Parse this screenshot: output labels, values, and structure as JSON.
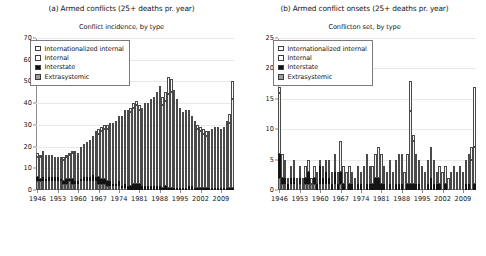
{
  "figure": {
    "panels": [
      {
        "id": "a",
        "title": "(a) Armed conflicts (25+ deaths pr. year)",
        "subtitle": "Conflict incidence, by type"
      },
      {
        "id": "b",
        "title": "(b) Armed conflict onsets (25+ deaths pr. year)",
        "subtitle": "Conflicton set, by type"
      }
    ],
    "legend": {
      "entries": [
        {
          "label": "Internationalized internal",
          "color": "#ffffff"
        },
        {
          "label": "Internal",
          "color": "#ffffff"
        },
        {
          "label": "Interstate",
          "color": "#101010"
        },
        {
          "label": "Extrasystemic",
          "color": "#9d9d9d"
        }
      ]
    }
  },
  "chart_data": [
    {
      "type": "bar",
      "stacked": true,
      "panel": "a",
      "title": "(a) Armed conflicts (25+ deaths pr. year)",
      "subtitle": "Conflict incidence, by type",
      "xlabel": "",
      "ylabel": "",
      "ylim": [
        0,
        70
      ],
      "yticks": [
        0,
        10,
        20,
        30,
        40,
        50,
        60,
        70
      ],
      "xticks": [
        1946,
        1953,
        1960,
        1967,
        1974,
        1981,
        1988,
        1995,
        2002,
        2009
      ],
      "grid": true,
      "legend_position": "upper-left",
      "categories": [
        1946,
        1947,
        1948,
        1949,
        1950,
        1951,
        1952,
        1953,
        1954,
        1955,
        1956,
        1957,
        1958,
        1959,
        1960,
        1961,
        1962,
        1963,
        1964,
        1965,
        1966,
        1967,
        1968,
        1969,
        1970,
        1971,
        1972,
        1973,
        1974,
        1975,
        1976,
        1977,
        1978,
        1979,
        1980,
        1981,
        1982,
        1983,
        1984,
        1985,
        1986,
        1987,
        1988,
        1989,
        1990,
        1991,
        1992,
        1993,
        1994,
        1995,
        1996,
        1997,
        1998,
        1999,
        2000,
        2001,
        2002,
        2003,
        2004,
        2005,
        2006,
        2007,
        2008,
        2009,
        2010,
        2011,
        2012,
        2013
      ],
      "series": [
        {
          "name": "Extrasystemic",
          "values": [
            4,
            4,
            4,
            4,
            4,
            4,
            4,
            4,
            4,
            3,
            3,
            4,
            3,
            3,
            3,
            4,
            4,
            4,
            4,
            4,
            4,
            3,
            3,
            3,
            2,
            2,
            2,
            2,
            2,
            1,
            1,
            0,
            0,
            0,
            0,
            0,
            0,
            0,
            0,
            0,
            0,
            0,
            0,
            0,
            0,
            0,
            0,
            0,
            0,
            0,
            0,
            0,
            0,
            0,
            0,
            0,
            0,
            0,
            0,
            0,
            0,
            0,
            0,
            0,
            0,
            0,
            0,
            0
          ]
        },
        {
          "name": "Interstate",
          "values": [
            2,
            1,
            2,
            1,
            2,
            2,
            2,
            2,
            1,
            1,
            2,
            1,
            2,
            1,
            1,
            1,
            2,
            2,
            2,
            3,
            2,
            3,
            2,
            2,
            2,
            2,
            1,
            1,
            2,
            1,
            2,
            2,
            2,
            3,
            3,
            3,
            2,
            2,
            2,
            2,
            2,
            2,
            2,
            1,
            2,
            1,
            1,
            1,
            1,
            1,
            1,
            1,
            2,
            2,
            1,
            1,
            1,
            1,
            1,
            1,
            1,
            1,
            1,
            1,
            1,
            1,
            1,
            1
          ]
        },
        {
          "name": "Internal",
          "values": [
            9,
            10,
            11,
            10,
            9,
            9,
            8,
            8,
            9,
            10,
            10,
            11,
            12,
            13,
            12,
            14,
            14,
            15,
            16,
            17,
            19,
            20,
            22,
            23,
            24,
            25,
            26,
            27,
            28,
            30,
            32,
            33,
            34,
            35,
            36,
            34,
            33,
            35,
            34,
            35,
            36,
            38,
            40,
            38,
            39,
            43,
            44,
            42,
            38,
            34,
            32,
            33,
            32,
            30,
            29,
            27,
            26,
            25,
            24,
            24,
            25,
            26,
            26,
            25,
            26,
            28,
            30,
            41
          ]
        },
        {
          "name": "Internationalized internal",
          "values": [
            2,
            1,
            1,
            1,
            1,
            1,
            1,
            1,
            1,
            1,
            1,
            1,
            1,
            1,
            1,
            1,
            1,
            1,
            1,
            1,
            2,
            2,
            2,
            2,
            2,
            2,
            2,
            2,
            2,
            2,
            2,
            2,
            2,
            2,
            2,
            2,
            3,
            3,
            4,
            5,
            5,
            5,
            6,
            4,
            4,
            8,
            6,
            3,
            3,
            3,
            3,
            3,
            3,
            2,
            2,
            2,
            2,
            2,
            2,
            2,
            2,
            2,
            2,
            2,
            2,
            3,
            4,
            8
          ]
        }
      ],
      "totals": [
        17,
        16,
        18,
        16,
        16,
        16,
        15,
        15,
        15,
        15,
        16,
        17,
        18,
        18,
        17,
        20,
        21,
        22,
        23,
        25,
        27,
        28,
        29,
        30,
        30,
        31,
        31,
        32,
        34,
        34,
        37,
        35,
        38,
        40,
        41,
        39,
        38,
        40,
        40,
        42,
        43,
        45,
        48,
        43,
        45,
        52,
        51,
        46,
        42,
        38,
        36,
        37,
        37,
        34,
        32,
        30,
        29,
        28,
        27,
        27,
        28,
        29,
        29,
        28,
        29,
        32,
        35,
        50
      ],
      "peak": {
        "year": 1991,
        "value": 52
      },
      "notes": "Stacked bars; totals rise from ~17 in 1946 to peak ~52 in 1991, decline to ~27-29 in the 2000s, then rise to ~50 in 2013."
    },
    {
      "type": "bar",
      "stacked": true,
      "panel": "b",
      "title": "(b) Armed conflict onsets (25+ deaths pr. year)",
      "subtitle": "Conflicton set, by type",
      "xlabel": "",
      "ylabel": "",
      "ylim": [
        0,
        25
      ],
      "yticks": [
        0,
        5,
        10,
        15,
        20,
        25
      ],
      "xticks": [
        1946,
        1953,
        1960,
        1967,
        1974,
        1981,
        1988,
        1995,
        2002,
        2009
      ],
      "grid": true,
      "legend_position": "upper-left",
      "categories": [
        1946,
        1947,
        1948,
        1949,
        1950,
        1951,
        1952,
        1953,
        1954,
        1955,
        1956,
        1957,
        1958,
        1959,
        1960,
        1961,
        1962,
        1963,
        1964,
        1965,
        1966,
        1967,
        1968,
        1969,
        1970,
        1971,
        1972,
        1973,
        1974,
        1975,
        1976,
        1977,
        1978,
        1979,
        1980,
        1981,
        1982,
        1983,
        1984,
        1985,
        1986,
        1987,
        1988,
        1989,
        1990,
        1991,
        1992,
        1993,
        1994,
        1995,
        1996,
        1997,
        1998,
        1999,
        2000,
        2001,
        2002,
        2003,
        2004,
        2005,
        2006,
        2007,
        2008,
        2009,
        2010,
        2011,
        2012,
        2013
      ],
      "series": [
        {
          "name": "Extrasystemic",
          "values": [
            2,
            1,
            1,
            0,
            1,
            1,
            1,
            1,
            1,
            1,
            1,
            1,
            1,
            0,
            1,
            1,
            1,
            1,
            0,
            1,
            0,
            1,
            0,
            0,
            0,
            0,
            0,
            0,
            0,
            0,
            0,
            0,
            0,
            0,
            0,
            0,
            0,
            0,
            0,
            0,
            0,
            0,
            0,
            0,
            0,
            0,
            0,
            0,
            0,
            0,
            0,
            0,
            0,
            0,
            0,
            0,
            0,
            0,
            0,
            0,
            0,
            0,
            0,
            0,
            0,
            0,
            0,
            0
          ]
        },
        {
          "name": "Interstate",
          "values": [
            4,
            1,
            1,
            1,
            1,
            1,
            0,
            1,
            0,
            1,
            2,
            0,
            1,
            1,
            3,
            1,
            2,
            1,
            1,
            2,
            1,
            2,
            1,
            0,
            1,
            1,
            0,
            1,
            1,
            0,
            1,
            1,
            1,
            2,
            2,
            1,
            1,
            0,
            1,
            0,
            1,
            1,
            1,
            0,
            1,
            1,
            1,
            1,
            1,
            0,
            0,
            1,
            2,
            1,
            1,
            1,
            0,
            1,
            0,
            0,
            0,
            0,
            0,
            0,
            1,
            1,
            0,
            1
          ]
        },
        {
          "name": "Internal",
          "values": [
            10,
            4,
            3,
            1,
            2,
            3,
            1,
            2,
            1,
            2,
            2,
            1,
            2,
            2,
            1,
            2,
            2,
            3,
            2,
            3,
            2,
            5,
            3,
            3,
            3,
            2,
            2,
            3,
            2,
            4,
            5,
            3,
            3,
            4,
            5,
            5,
            3,
            3,
            4,
            3,
            4,
            5,
            5,
            3,
            5,
            12,
            7,
            5,
            4,
            4,
            3,
            4,
            5,
            4,
            2,
            3,
            3,
            3,
            2,
            3,
            4,
            3,
            4,
            3,
            4,
            4,
            5,
            6
          ]
        },
        {
          "name": "Internationalized internal",
          "values": [
            1,
            0,
            0,
            0,
            0,
            0,
            0,
            0,
            0,
            0,
            0,
            0,
            0,
            0,
            0,
            0,
            0,
            0,
            0,
            0,
            0,
            0,
            0,
            0,
            0,
            0,
            0,
            0,
            0,
            0,
            0,
            0,
            0,
            0,
            0,
            0,
            0,
            0,
            0,
            0,
            0,
            0,
            0,
            0,
            0,
            5,
            1,
            0,
            0,
            0,
            0,
            0,
            0,
            0,
            0,
            0,
            0,
            0,
            0,
            0,
            0,
            0,
            0,
            0,
            0,
            1,
            2,
            10
          ]
        }
      ],
      "totals": [
        17,
        6,
        5,
        2,
        4,
        5,
        2,
        4,
        2,
        4,
        5,
        2,
        4,
        3,
        5,
        4,
        5,
        5,
        3,
        6,
        3,
        8,
        4,
        3,
        4,
        3,
        2,
        4,
        3,
        4,
        6,
        4,
        4,
        6,
        7,
        6,
        4,
        3,
        5,
        3,
        5,
        6,
        6,
        3,
        6,
        18,
        9,
        6,
        5,
        4,
        3,
        5,
        7,
        5,
        3,
        4,
        3,
        4,
        2,
        3,
        4,
        3,
        4,
        3,
        5,
        6,
        7,
        17
      ],
      "peak": {
        "year": 1991,
        "value": 18
      },
      "notes": "Spiky stacked onset counts; 1946 ~17, large spike ~18 in 1991, final bar ~17 in 2013."
    }
  ]
}
